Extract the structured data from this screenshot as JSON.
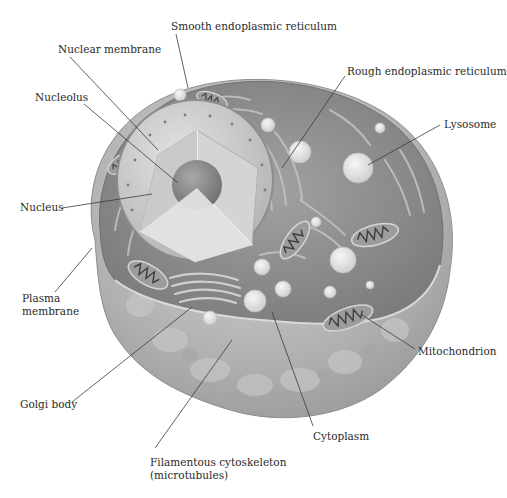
{
  "diagram": {
    "colors": {
      "background": "#ffffff",
      "label_text": "#2a2a2a",
      "leader_line": "#3a3a3a",
      "cell_outer": "#b9b9b9",
      "cytoplasm": "#8f8f8f",
      "nucleus": "#cfcfcf",
      "nucleolus": "#8a8a8a",
      "vesicle": "#e6e6e6"
    },
    "labels": [
      {
        "id": "smooth-er",
        "text": "Smooth endoplasmic reticulum",
        "x": 171,
        "y": 20,
        "line": [
          [
            176,
            34
          ],
          [
            188,
            88
          ]
        ]
      },
      {
        "id": "nuclear-membrane",
        "text": "Nuclear membrane",
        "x": 58,
        "y": 43,
        "line": [
          [
            70,
            57
          ],
          [
            158,
            150
          ]
        ]
      },
      {
        "id": "rough-er",
        "text": "Rough endoplasmic reticulum",
        "x": 347,
        "y": 65,
        "line": [
          [
            345,
            76
          ],
          [
            282,
            168
          ]
        ]
      },
      {
        "id": "nucleolus",
        "text": "Nucleolus",
        "x": 35,
        "y": 91,
        "line": [
          [
            84,
            104
          ],
          [
            178,
            183
          ]
        ]
      },
      {
        "id": "lysosome",
        "text": "Lysosome",
        "x": 444,
        "y": 118,
        "line": [
          [
            440,
            125
          ],
          [
            368,
            165
          ]
        ]
      },
      {
        "id": "nucleus",
        "text": "Nucleus",
        "x": 20,
        "y": 201,
        "line": [
          [
            62,
            208
          ],
          [
            152,
            194
          ]
        ]
      },
      {
        "id": "plasma-membrane",
        "text": "Plasma\nmembrane",
        "x": 22,
        "y": 292,
        "line": [
          [
            55,
            292
          ],
          [
            92,
            248
          ]
        ]
      },
      {
        "id": "mitochondrion",
        "text": "Mitochondrion",
        "x": 418,
        "y": 345,
        "line": [
          [
            415,
            349
          ],
          [
            362,
            315
          ]
        ]
      },
      {
        "id": "golgi-body",
        "text": "Golgi body",
        "x": 20,
        "y": 398,
        "line": [
          [
            72,
            402
          ],
          [
            192,
            307
          ]
        ]
      },
      {
        "id": "cytoplasm",
        "text": "Cytoplasm",
        "x": 313,
        "y": 430,
        "line": [
          [
            313,
            426
          ],
          [
            272,
            312
          ]
        ]
      },
      {
        "id": "cytoskeleton",
        "text": "Filamentous cytoskeleton\n(microtubules)",
        "x": 150,
        "y": 456,
        "line": [
          [
            155,
            448
          ],
          [
            232,
            340
          ]
        ]
      }
    ]
  }
}
